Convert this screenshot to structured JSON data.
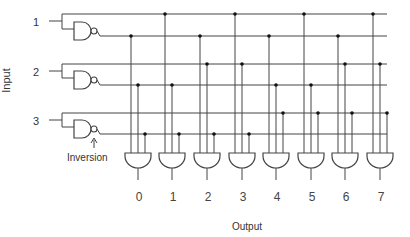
{
  "diagram": {
    "input_axis_label": "Input",
    "output_axis_label": "Output",
    "inversion_label": "Inversion",
    "inputs": [
      {
        "label": "1",
        "true_line_y": 14,
        "inv_line_y": 36,
        "label_y": 21
      },
      {
        "label": "2",
        "true_line_y": 64,
        "inv_line_y": 85,
        "label_y": 71
      },
      {
        "label": "3",
        "true_line_y": 113,
        "inv_line_y": 134,
        "label_y": 120
      }
    ],
    "outputs": [
      {
        "label": "0",
        "x": 138,
        "taps": [
          "inv",
          "inv",
          "inv"
        ]
      },
      {
        "label": "1",
        "x": 172,
        "taps": [
          "true",
          "inv",
          "inv"
        ]
      },
      {
        "label": "2",
        "x": 207,
        "taps": [
          "inv",
          "true",
          "inv"
        ]
      },
      {
        "label": "3",
        "x": 242,
        "taps": [
          "true",
          "true",
          "inv"
        ]
      },
      {
        "label": "4",
        "x": 276,
        "taps": [
          "inv",
          "inv",
          "true"
        ]
      },
      {
        "label": "5",
        "x": 311,
        "taps": [
          "true",
          "inv",
          "true"
        ]
      },
      {
        "label": "6",
        "x": 345,
        "taps": [
          "inv",
          "true",
          "true"
        ]
      },
      {
        "label": "7",
        "x": 380,
        "taps": [
          "true",
          "true",
          "true"
        ]
      }
    ],
    "colors": {
      "line": "#444444",
      "background": "#ffffff"
    }
  }
}
